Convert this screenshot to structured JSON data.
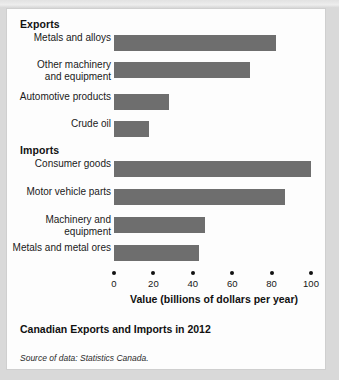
{
  "figure": {
    "caption": "Canadian Exports and Imports in 2012",
    "source_label": "Source of data:",
    "source_value": "Statistics Canada.",
    "bar_color": "#6e6e6e",
    "panel_background": "#fdfdfd",
    "page_background": "#d9d9d9"
  },
  "sections": {
    "exports_heading": "Exports",
    "imports_heading": "Imports"
  },
  "axis": {
    "title": "Value (billions of dollars per year)",
    "ticks": [
      "0",
      "20",
      "40",
      "60",
      "80",
      "100"
    ],
    "min": 0,
    "max": 100
  },
  "chart_data": {
    "type": "bar",
    "orientation": "horizontal",
    "title": "Canadian Exports and Imports in 2012",
    "xlabel": "Value (billions of dollars per year)",
    "ylabel": "",
    "xlim": [
      0,
      100
    ],
    "grid": false,
    "legend": "none",
    "groups": [
      {
        "name": "Exports",
        "categories": [
          "Metals and alloys",
          "Other machinery and equipment",
          "Automotive products",
          "Crude oil"
        ],
        "values": [
          82,
          69,
          28,
          18
        ]
      },
      {
        "name": "Imports",
        "categories": [
          "Consumer goods",
          "Motor vehicle parts",
          "Machinery and equipment",
          "Metals and metal ores"
        ],
        "values": [
          100,
          87,
          46,
          43
        ]
      }
    ],
    "bars": [
      {
        "group": "Exports",
        "label": "Metals and alloys",
        "label_lines": [
          "Metals and alloys"
        ],
        "value": 82,
        "top": 26
      },
      {
        "group": "Exports",
        "label": "Other machinery and equipment",
        "label_lines": [
          "Other machinery",
          "and equipment"
        ],
        "value": 69,
        "top": 53
      },
      {
        "group": "Exports",
        "label": "Automotive products",
        "label_lines": [
          "Automotive products"
        ],
        "value": 28,
        "top": 85
      },
      {
        "group": "Exports",
        "label": "Crude oil",
        "label_lines": [
          "Crude oil"
        ],
        "value": 18,
        "top": 112
      },
      {
        "group": "Imports",
        "label": "Consumer goods",
        "label_lines": [
          "Consumer goods"
        ],
        "value": 100,
        "top": 152
      },
      {
        "group": "Imports",
        "label": "Motor vehicle parts",
        "label_lines": [
          "Motor vehicle parts"
        ],
        "value": 87,
        "top": 180
      },
      {
        "group": "Imports",
        "label": "Machinery and equipment",
        "label_lines": [
          "Machinery and",
          "equipment"
        ],
        "value": 46,
        "top": 208
      },
      {
        "group": "Imports",
        "label": "Metals and metal ores",
        "label_lines": [
          "Metals and metal ores"
        ],
        "value": 43,
        "top": 236
      }
    ],
    "source": "Source of data: Statistics Canada."
  }
}
